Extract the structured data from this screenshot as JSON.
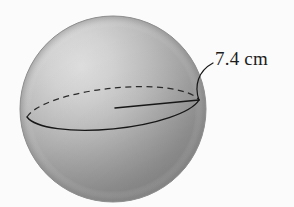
{
  "figure": {
    "type": "geometry-diagram",
    "background_color": "#fbfbfb",
    "sphere": {
      "name": "shaded-sphere",
      "center_x": 113,
      "center_y": 109,
      "radius_px": 93,
      "highlight_color": "#dcdcdc",
      "midtone_color": "#b4b4b4",
      "shadow_color": "#949494",
      "edge_color": "#8d8d8d"
    },
    "equator": {
      "name": "equator-ellipse",
      "center_x": 113,
      "center_y": 108,
      "radius_x": 88,
      "radius_y": 25,
      "rotation_deg": -6,
      "front_arc_style": "solid",
      "back_arc_style": "dashed",
      "line_color": "#1a1a1a"
    },
    "radius_line": {
      "name": "radius-segment",
      "from_x": 115,
      "from_y": 108,
      "to_x": 199,
      "to_y": 100,
      "line_color": "#1a1a1a"
    },
    "leader_line": {
      "name": "leader-line",
      "from_x": 199,
      "from_y": 100,
      "to_x": 213,
      "to_y": 62,
      "line_color": "#1a1a1a"
    },
    "label": {
      "text": "7.4 cm",
      "value": "7.4",
      "unit": "cm",
      "color": "#1d1d1d"
    }
  }
}
